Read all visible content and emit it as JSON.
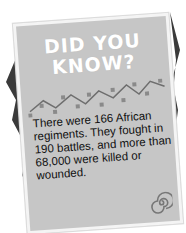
{
  "card": {
    "title_line1": "DID YOU",
    "title_line2": "KNOW?",
    "body": "There were 166 African regiments. They fought in 190 battles, and more than 68,000 were killed or wounded.",
    "icons": [
      "zigzag-pattern",
      "spiral-icon"
    ],
    "colors": {
      "card": "#c6c6c6",
      "border": "#f4f4f4",
      "shadow": "#3a3a3a",
      "title": "#ffffff",
      "text": "#111111",
      "pattern": "#7a7a7a"
    }
  }
}
